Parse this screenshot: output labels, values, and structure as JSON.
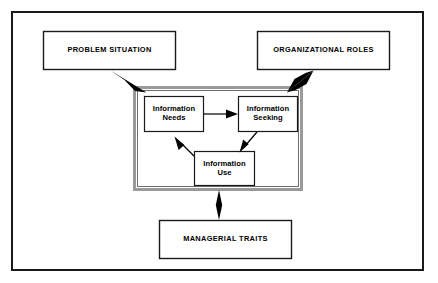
{
  "figure": {
    "frame": {
      "name": "outer-border",
      "x": 11,
      "y": 11,
      "w": 413,
      "h": 260,
      "stroke": "#1a1a1a",
      "stroke_width": 2,
      "fill": "#ffffff"
    },
    "container": {
      "name": "information-process-container",
      "x": 133,
      "y": 86,
      "w": 170,
      "h": 105,
      "stroke": "#8c8c8c",
      "stroke_width": 3,
      "inner_stroke": "#5a5a5a",
      "fill": "#ffffff"
    },
    "nodes": [
      {
        "id": "problem-situation",
        "label": "PROBLEM SITUATION",
        "style": "outer",
        "x": 43,
        "y": 31,
        "w": 133,
        "h": 39,
        "stroke": "#1a1a1a",
        "stroke_width": 1.4,
        "fill": "#ffffff"
      },
      {
        "id": "organizational-roles",
        "label": "ORGANIZATIONAL ROLES",
        "style": "outer",
        "x": 257,
        "y": 31,
        "w": 133,
        "h": 39,
        "stroke": "#1a1a1a",
        "stroke_width": 1.4,
        "fill": "#ffffff"
      },
      {
        "id": "information-needs",
        "label": "Information\nNeeds",
        "line1": "Information",
        "line2": "Needs",
        "style": "inner",
        "x": 144,
        "y": 96,
        "w": 60,
        "h": 36,
        "stroke": "#1a1a1a",
        "stroke_width": 1.2,
        "fill": "#ffffff"
      },
      {
        "id": "information-seeking",
        "label": "Information\nSeeking",
        "line1": "Information",
        "line2": "Seeking",
        "style": "inner",
        "x": 238,
        "y": 96,
        "w": 60,
        "h": 36,
        "stroke": "#1a1a1a",
        "stroke_width": 1.2,
        "fill": "#ffffff"
      },
      {
        "id": "information-use",
        "label": "Information\nUse",
        "line1": "Information",
        "line2": "Use",
        "style": "inner",
        "x": 194,
        "y": 151,
        "w": 61,
        "h": 35,
        "stroke": "#1a1a1a",
        "stroke_width": 1.2,
        "fill": "#ffffff"
      },
      {
        "id": "managerial-traits",
        "label": "MANAGERIAL TRAITS",
        "style": "outer",
        "x": 159,
        "y": 220,
        "w": 133,
        "h": 39,
        "stroke": "#1a1a1a",
        "stroke_width": 1.4,
        "fill": "#ffffff"
      }
    ],
    "connectors": [
      {
        "id": "problem-to-process",
        "from": "problem-situation",
        "to": "information-process-container",
        "kind": "tapered-arrow",
        "heads": "single",
        "direction": "down-right",
        "color": "#000000"
      },
      {
        "id": "roles-to-process",
        "from": "organizational-roles",
        "to": "information-process-container",
        "kind": "tapered-arrow",
        "heads": "double",
        "direction": "down-left",
        "color": "#000000"
      },
      {
        "id": "needs-to-seeking",
        "from": "information-needs",
        "to": "information-seeking",
        "kind": "line-arrow",
        "heads": "single",
        "direction": "right",
        "color": "#000000"
      },
      {
        "id": "seeking-to-use",
        "from": "information-seeking",
        "to": "information-use",
        "kind": "line-arrow",
        "heads": "single",
        "direction": "down-left",
        "color": "#000000"
      },
      {
        "id": "use-to-needs",
        "from": "information-use",
        "to": "information-needs",
        "kind": "line-arrow",
        "heads": "single",
        "direction": "up-left",
        "color": "#000000"
      },
      {
        "id": "process-to-traits",
        "from": "information-process-container",
        "to": "managerial-traits",
        "kind": "tapered-arrow",
        "heads": "double",
        "direction": "vertical",
        "color": "#000000"
      }
    ]
  }
}
